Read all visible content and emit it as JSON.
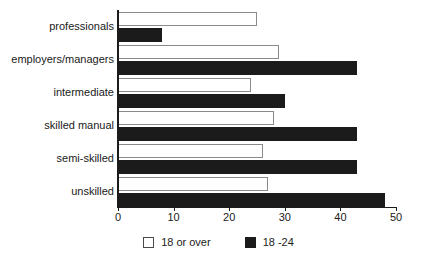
{
  "chart_data": {
    "type": "bar",
    "orientation": "horizontal",
    "title": "",
    "xlabel": "",
    "ylabel": "",
    "xlim": [
      0,
      50
    ],
    "xticks": [
      0,
      10,
      20,
      30,
      40,
      50
    ],
    "xtick_labels": [
      "0",
      "10",
      "20",
      "30",
      "40",
      "50"
    ],
    "grid": false,
    "legend_position": "bottom-center",
    "categories": [
      "professionals",
      "employers/managers",
      "intermediate",
      "skilled manual",
      "semi-skilled",
      "unskilled"
    ],
    "series": [
      {
        "name": "18 or over",
        "color": "#ffffff",
        "edge_color": "#8a8a8a",
        "values": [
          25,
          29,
          24,
          28,
          26,
          27
        ]
      },
      {
        "name": "18 -24",
        "color": "#1b1b1b",
        "edge_color": "#1b1b1b",
        "values": [
          8,
          43,
          30,
          43,
          43,
          48
        ]
      }
    ]
  },
  "legend": {
    "items": [
      {
        "label": "18 or over",
        "swatch": "white-square-outline"
      },
      {
        "label": "18 -24",
        "swatch": "black-square"
      }
    ]
  },
  "axes": {
    "x_tick_labels": [
      "0",
      "10",
      "20",
      "30",
      "40",
      "50"
    ]
  }
}
